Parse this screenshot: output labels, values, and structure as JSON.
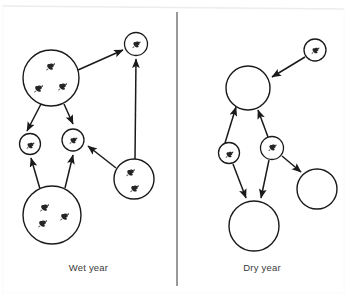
{
  "figure": {
    "background_color": "#ffffff",
    "frame_color": "#e8e8e8",
    "stroke_color": "#1a1a1a",
    "glyph_color": "#262626",
    "caption_color": "#3a3a3a",
    "width": 347,
    "height": 301
  },
  "divider": {
    "name": "panel-divider",
    "x": 177,
    "y_top": 12,
    "y_bottom": 286,
    "color": "#555555"
  },
  "panels": [
    {
      "id": "wet",
      "caption": "Wet year",
      "nodes": [
        {
          "id": "wet-large-top-left",
          "label": "",
          "cx": 51,
          "cy": 78,
          "r": 28,
          "occupants": 3
        },
        {
          "id": "wet-small-top-right",
          "label": "",
          "cx": 136,
          "cy": 44,
          "r": 11.5,
          "occupants": 1
        },
        {
          "id": "wet-small-mid-left",
          "label": "",
          "cx": 30,
          "cy": 144,
          "r": 10.5,
          "occupants": 1
        },
        {
          "id": "wet-small-mid-center",
          "label": "",
          "cx": 73,
          "cy": 140,
          "r": 11,
          "occupants": 1
        },
        {
          "id": "wet-medium-mid-right",
          "label": "",
          "cx": 134,
          "cy": 179,
          "r": 20,
          "occupants": 2
        },
        {
          "id": "wet-large-bottom-left",
          "label": "",
          "cx": 52,
          "cy": 215,
          "r": 29,
          "occupants": 3
        }
      ],
      "edges": [
        {
          "from": "wet-large-top-left",
          "to": "wet-small-top-right",
          "type": "arrow"
        },
        {
          "from": "wet-large-top-left",
          "to": "wet-small-mid-left",
          "type": "arrow"
        },
        {
          "from": "wet-large-top-left",
          "to": "wet-small-mid-center",
          "type": "arrow"
        },
        {
          "from": "wet-large-bottom-left",
          "to": "wet-small-mid-left",
          "type": "arrow"
        },
        {
          "from": "wet-large-bottom-left",
          "to": "wet-small-mid-center",
          "type": "arrow"
        },
        {
          "from": "wet-medium-mid-right",
          "to": "wet-small-mid-center",
          "type": "arrow"
        },
        {
          "from": "wet-medium-mid-right",
          "to": "wet-small-top-right",
          "type": "arrow"
        }
      ]
    },
    {
      "id": "dry",
      "caption": "Dry year",
      "nodes": [
        {
          "id": "dry-large-top",
          "label": "",
          "cx": 248,
          "cy": 88,
          "r": 22,
          "occupants": 0
        },
        {
          "id": "dry-small-top-right",
          "label": "",
          "cx": 315,
          "cy": 50,
          "r": 11,
          "occupants": 1
        },
        {
          "id": "dry-small-mid-left",
          "label": "",
          "cx": 229,
          "cy": 153,
          "r": 10.5,
          "occupants": 1
        },
        {
          "id": "dry-small-mid-center",
          "label": "",
          "cx": 272,
          "cy": 148,
          "r": 11.5,
          "occupants": 1
        },
        {
          "id": "dry-medium-right",
          "label": "",
          "cx": 317,
          "cy": 189,
          "r": 20,
          "occupants": 0
        },
        {
          "id": "dry-large-bottom",
          "label": "",
          "cx": 254,
          "cy": 226,
          "r": 25,
          "occupants": 0
        }
      ],
      "edges": [
        {
          "from": "dry-small-top-right",
          "to": "dry-large-top",
          "type": "arrow"
        },
        {
          "from": "dry-small-mid-left",
          "to": "dry-large-top",
          "type": "arrow"
        },
        {
          "from": "dry-small-mid-center",
          "to": "dry-large-top",
          "type": "arrow"
        },
        {
          "from": "dry-small-mid-left",
          "to": "dry-large-bottom",
          "type": "arrow"
        },
        {
          "from": "dry-small-mid-center",
          "to": "dry-large-bottom",
          "type": "arrow"
        },
        {
          "from": "dry-small-mid-center",
          "to": "dry-medium-right",
          "type": "arrow"
        }
      ]
    }
  ],
  "icons": {
    "occupant": "animal-glyph",
    "arrow": "arrow-head-icon"
  }
}
